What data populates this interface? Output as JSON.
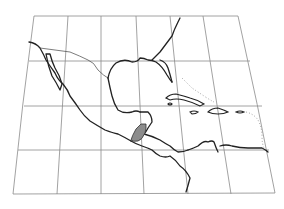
{
  "map": {
    "region": "Central America and the Caribbean",
    "highlighted_country": "Guatemala",
    "colors": {
      "background": "#ffffff",
      "grid": "#8a8a8a",
      "coastline": "#222222",
      "highlight_fill": "#8c8c8c"
    },
    "graticule": {
      "rows": 4,
      "columns": 6
    }
  }
}
